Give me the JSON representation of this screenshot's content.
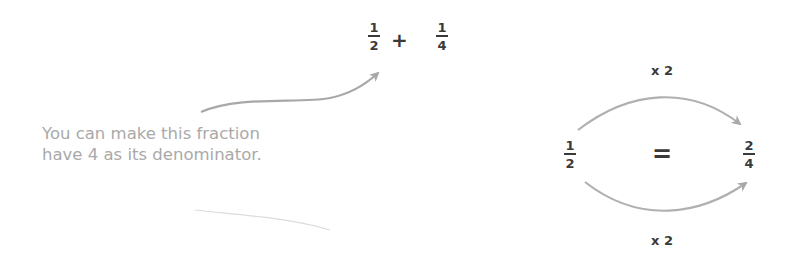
{
  "expression": {
    "left_fraction": {
      "numerator": "1",
      "denominator": "2"
    },
    "operator": "+",
    "right_fraction": {
      "numerator": "1",
      "denominator": "4"
    }
  },
  "note": {
    "line1": "You can make this fraction",
    "line2": "have 4 as its denominator."
  },
  "equivalence": {
    "left_fraction": {
      "numerator": "1",
      "denominator": "2"
    },
    "operator": "=",
    "right_fraction": {
      "numerator": "2",
      "denominator": "4"
    },
    "top_label": "x 2",
    "bottom_label": "x 2"
  },
  "colors": {
    "text": "#3a3a3a",
    "note_text": "#a9a9a9",
    "arrow": "#a8a8a8"
  }
}
